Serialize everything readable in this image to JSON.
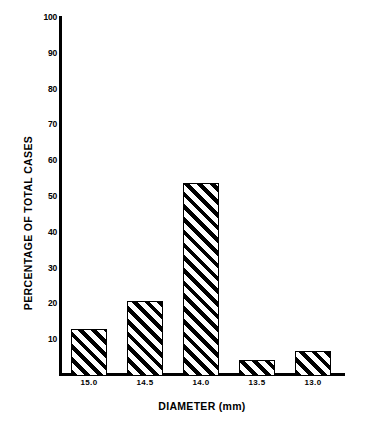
{
  "chart_data": {
    "type": "bar",
    "title": "",
    "xlabel": "DIAMETER (mm)",
    "ylabel": "PERCENTAGE OF TOTAL CASES",
    "categories": [
      "15.0",
      "14.5",
      "14.0",
      "13.5",
      "13.0"
    ],
    "values": [
      13,
      21,
      54,
      4.5,
      7
    ],
    "ylim": [
      0,
      100
    ],
    "yticks": [
      10,
      20,
      30,
      40,
      50,
      60,
      70,
      80,
      90,
      100
    ],
    "ytick_labels": [
      "10",
      "20",
      "30",
      "40",
      "50",
      "60",
      "70",
      "80",
      "90",
      "100"
    ],
    "grid": false,
    "legend": null,
    "bar_style": {
      "fill": "diagonal-hatch",
      "hatch_angle_deg": 45,
      "edge_color": "#000000",
      "face_color": "#ffffff"
    },
    "background_color": "#ffffff",
    "axis_color": "#000000"
  },
  "axes": {
    "y_axis_title": "PERCENTAGE OF TOTAL CASES",
    "x_axis_title": "DIAMETER (mm)"
  }
}
